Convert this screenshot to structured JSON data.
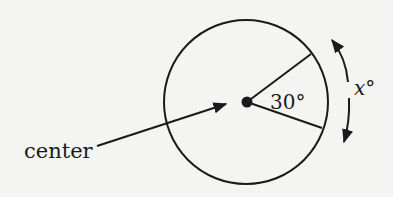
{
  "diagram": {
    "type": "circle-central-angle",
    "labels": {
      "center": "center",
      "angle": "30°",
      "arc": "x°"
    },
    "circle": {
      "cx": 246,
      "cy": 102,
      "r": 82
    },
    "central_angle_degrees": 30,
    "arc_measure": "x",
    "colors": {
      "stroke": "#1a1a1a",
      "background": "#f4f4f2"
    }
  }
}
